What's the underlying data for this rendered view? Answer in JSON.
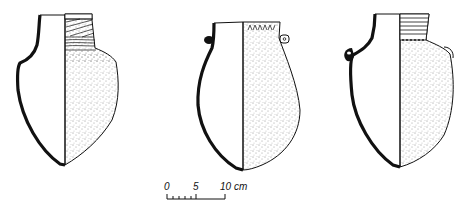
{
  "figure": {
    "type": "archaeological pottery drawing",
    "vessels": [
      {
        "id": "vessel-1",
        "form": "shouldered jar with decorated neck",
        "decoration": "hatched/incised neck bands, stippled body"
      },
      {
        "id": "vessel-2",
        "form": "globular jar with small lug handles",
        "decoration": "notched rim band, stippled body"
      },
      {
        "id": "vessel-3",
        "form": "shouldered jar with lug handle",
        "decoration": "horizontal grooved neck, stippled body"
      }
    ],
    "scale_bar": {
      "labels": [
        "0",
        "5",
        "10 cm"
      ],
      "unit": "cm",
      "max": 10
    }
  },
  "colors": {
    "ink": "#111111",
    "background": "#ffffff"
  }
}
